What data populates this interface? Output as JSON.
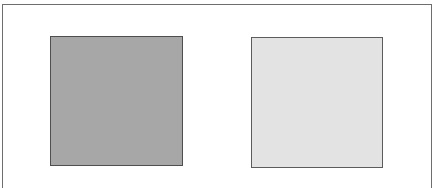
{
  "figure": {
    "frame": {
      "border_color": "#6e6e6e"
    },
    "squares": [
      {
        "id": "left",
        "shade": "dark gray",
        "fill_color": "#a7a7a7",
        "border_color": "#4f4f4f"
      },
      {
        "id": "right",
        "shade": "light gray",
        "fill_color": "#e3e3e3",
        "border_color": "#5c5c5c"
      }
    ]
  }
}
